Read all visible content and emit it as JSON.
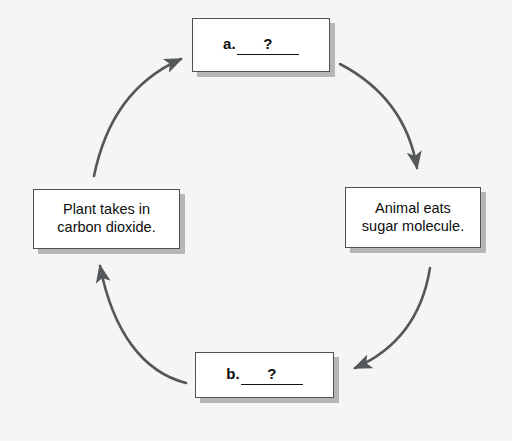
{
  "diagram": {
    "type": "cycle",
    "direction": "clockwise",
    "background_color": "#f6f6f5",
    "box_fill_color": "#ffffff",
    "box_border_color": "#4e5052",
    "box_shadow_color": "#b6b6b4",
    "arrow_color": "#55585a",
    "text_color": "#0d0d0d",
    "nodes": [
      {
        "id": "a",
        "position": "top",
        "kind": "blank",
        "marker": "a.",
        "answer": "?",
        "text": "a.  ?"
      },
      {
        "id": "animal-eats-sugar",
        "position": "right",
        "kind": "statement",
        "text": "Animal eats\nsugar molecule."
      },
      {
        "id": "b",
        "position": "bottom",
        "kind": "blank",
        "marker": "b.",
        "answer": "?",
        "text": "b.  ?"
      },
      {
        "id": "plant-takes-in-carbon-dioxide",
        "position": "left",
        "kind": "statement",
        "text": "Plant takes in\ncarbon dioxide."
      }
    ],
    "arrows": [
      {
        "id": "arrow-top-right",
        "from": "a",
        "to": "animal-eats-sugar",
        "points": "down-right"
      },
      {
        "id": "arrow-bottom-right",
        "from": "animal-eats-sugar",
        "to": "b",
        "points": "down-left"
      },
      {
        "id": "arrow-bottom-left",
        "from": "b",
        "to": "plant-takes-in-carbon-dioxide",
        "points": "up-left"
      },
      {
        "id": "arrow-top-left",
        "from": "plant-takes-in-carbon-dioxide",
        "to": "a",
        "points": "up-right"
      }
    ]
  }
}
